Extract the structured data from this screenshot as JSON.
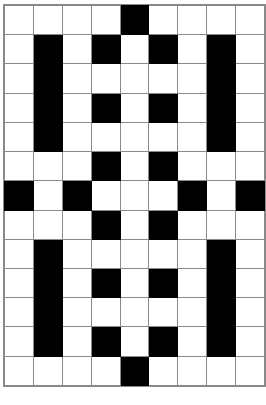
{
  "figure": {
    "type": "grid",
    "columns": 9,
    "rows": 13,
    "colors": {
      "filled": "#000000",
      "empty": "#ffffff",
      "gridline": "#8a8a8a",
      "background": "#ffffff"
    },
    "legend": {
      "filled_value": 1,
      "empty_value": 0
    }
  },
  "chart_data": {
    "type": "heatmap",
    "title": "",
    "xlabel": "",
    "ylabel": "",
    "grid": true,
    "legend_position": "none",
    "ncols": 9,
    "nrows": 13,
    "colormap": [
      "#ffffff",
      "#000000"
    ],
    "cells": [
      [
        0,
        0,
        0,
        0,
        1,
        0,
        0,
        0,
        0
      ],
      [
        0,
        1,
        0,
        1,
        0,
        1,
        0,
        1,
        0
      ],
      [
        0,
        1,
        0,
        0,
        0,
        0,
        0,
        1,
        0
      ],
      [
        0,
        1,
        0,
        1,
        0,
        1,
        0,
        1,
        0
      ],
      [
        0,
        1,
        0,
        0,
        0,
        0,
        0,
        1,
        0
      ],
      [
        0,
        0,
        0,
        1,
        0,
        1,
        0,
        0,
        0
      ],
      [
        1,
        0,
        1,
        0,
        0,
        0,
        1,
        0,
        1
      ],
      [
        0,
        0,
        0,
        1,
        0,
        1,
        0,
        0,
        0
      ],
      [
        0,
        1,
        0,
        0,
        0,
        0,
        0,
        1,
        0
      ],
      [
        0,
        1,
        0,
        1,
        0,
        1,
        0,
        1,
        0
      ],
      [
        0,
        1,
        0,
        0,
        0,
        0,
        0,
        1,
        0
      ],
      [
        0,
        1,
        0,
        1,
        0,
        1,
        0,
        1,
        0
      ],
      [
        0,
        0,
        0,
        0,
        1,
        0,
        0,
        0,
        0
      ]
    ],
    "row_labels": [],
    "column_labels": []
  }
}
